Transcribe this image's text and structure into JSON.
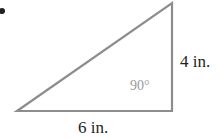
{
  "figure": {
    "name": "right-triangle-figure",
    "background_color": "#ffffff",
    "stroke_color": "#8d8d8d",
    "stroke_width": 2.2,
    "bullet_color": "#231f20"
  },
  "labels": {
    "height_label": "4 in.",
    "base_label": "6 in.",
    "angle_label": "90°",
    "height_label_color": "#231f20",
    "base_label_color": "#231f20",
    "angle_label_color": "#9a9a9a"
  },
  "chart_data": {
    "type": "diagram",
    "shape": "right triangle",
    "title": "",
    "vertices": [
      {
        "name": "bottom-left",
        "x": 17,
        "y": 111
      },
      {
        "name": "bottom-right",
        "x": 172,
        "y": 111
      },
      {
        "name": "top-right",
        "x": 172,
        "y": 3
      }
    ],
    "sides": [
      {
        "name": "base",
        "from": "bottom-left",
        "to": "bottom-right",
        "length": 6,
        "unit": "in.",
        "label": "6 in."
      },
      {
        "name": "height",
        "from": "bottom-right",
        "to": "top-right",
        "length": 4,
        "unit": "in.",
        "label": "4 in."
      },
      {
        "name": "hypotenuse",
        "from": "bottom-left",
        "to": "top-right",
        "length": null,
        "unit": "in.",
        "label": ""
      }
    ],
    "angles": [
      {
        "name": "right-angle",
        "at": "bottom-right",
        "value": 90,
        "unit": "degrees",
        "label": "90°"
      }
    ],
    "grid": false,
    "legend": null
  }
}
